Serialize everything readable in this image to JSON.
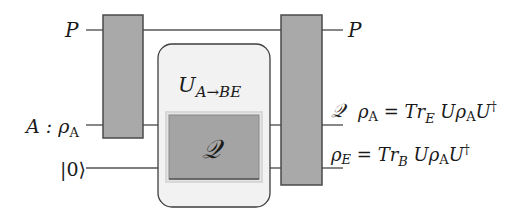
{
  "diagram": {
    "type": "quantum-circuit",
    "inputs": {
      "p_label": "P",
      "a_label_main": "A : ρ",
      "a_label_sub": "A",
      "ancilla_label": "|0⟩"
    },
    "channel_box": {
      "title_main": "U",
      "title_sub": "A→BE",
      "inner_gate_label": "𝒬"
    },
    "outputs": {
      "p_label": "P",
      "q_label": "𝒬",
      "rho_a_eq": {
        "rho": "ρ",
        "rho_sub": "A",
        "eq": " = ",
        "tr": "Tr",
        "tr_sub": "E",
        "u": " Uρ",
        "u_sub": "A",
        "u_end": "U",
        "dagger": "†"
      },
      "rho_e_eq": {
        "rho": "ρ",
        "rho_sub": "E",
        "eq": " = ",
        "tr": "Tr",
        "tr_sub": "B",
        "u": " Uρ",
        "u_sub": "A",
        "u_end": "U",
        "dagger": "†"
      }
    },
    "colors": {
      "gate_fill": "#a9a9a9",
      "box_fill": "#f2f2f2",
      "line": "#555555"
    }
  }
}
